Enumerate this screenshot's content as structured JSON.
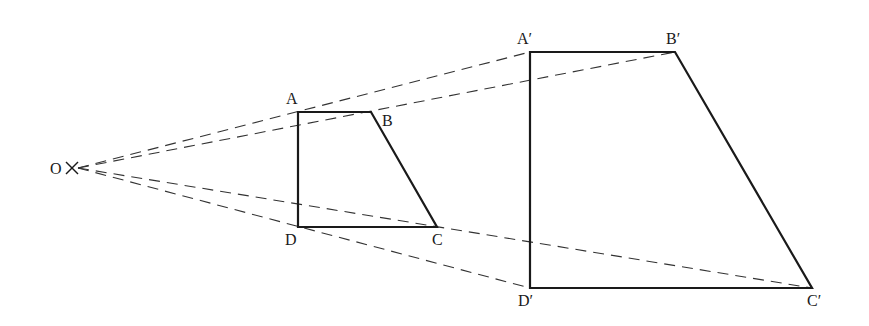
{
  "diagram": {
    "type": "enlargement",
    "centre": {
      "label": "O",
      "x": 72,
      "y": 168
    },
    "object": {
      "points": [
        {
          "label": "A",
          "x": 298,
          "y": 112,
          "lx": 286,
          "ly": 104
        },
        {
          "label": "B",
          "x": 371,
          "y": 112,
          "lx": 382,
          "ly": 126
        },
        {
          "label": "C",
          "x": 437,
          "y": 227,
          "lx": 432,
          "ly": 245
        },
        {
          "label": "D",
          "x": 298,
          "y": 227,
          "lx": 285,
          "ly": 245
        }
      ]
    },
    "image": {
      "points": [
        {
          "label": "A′",
          "x": 530,
          "y": 52,
          "lx": 517,
          "ly": 44
        },
        {
          "label": "B′",
          "x": 675,
          "y": 52,
          "lx": 666,
          "ly": 44
        },
        {
          "label": "C′",
          "x": 812,
          "y": 288,
          "lx": 807,
          "ly": 306
        },
        {
          "label": "D′",
          "x": 530,
          "y": 288,
          "lx": 518,
          "ly": 306
        }
      ]
    },
    "colors": {
      "line": "#1a1a1a",
      "dashed": "#333333",
      "background": "#ffffff"
    }
  }
}
